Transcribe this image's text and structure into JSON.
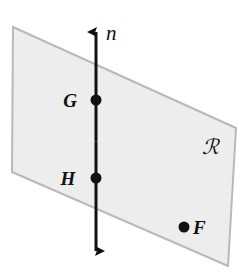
{
  "figure": {
    "background_color": "#ffffff",
    "width": 249,
    "height": 277
  },
  "plane": {
    "name": "plane-R",
    "label": "ℛ",
    "label_plain": "R",
    "fill_color": "#ededed",
    "stroke_color": "#b9b9b9",
    "stroke_width": 2,
    "corners": [
      {
        "x": 13,
        "y": 27
      },
      {
        "x": 236,
        "y": 128
      },
      {
        "x": 228,
        "y": 266
      },
      {
        "x": 12,
        "y": 172
      }
    ],
    "label_position": {
      "x": 202,
      "y": 154
    }
  },
  "line": {
    "name": "line-n",
    "label": "n",
    "color": "#111111",
    "stroke_width": 3,
    "x": 96,
    "top_tip_y": 26,
    "bottom_tip_y": 257,
    "arrowheads": "both",
    "label_position": {
      "x": 106,
      "y": 40
    }
  },
  "points": [
    {
      "id": "point-G",
      "label": "G",
      "x": 96,
      "y": 100,
      "radius": 5,
      "color": "#111111",
      "label_position": {
        "x": 70,
        "y": 107
      },
      "on_line": true
    },
    {
      "id": "point-H",
      "label": "H",
      "x": 96,
      "y": 178,
      "radius": 5,
      "color": "#111111",
      "label_position": {
        "x": 68,
        "y": 185
      },
      "on_line": true
    },
    {
      "id": "point-F",
      "label": "F",
      "x": 184,
      "y": 227,
      "radius": 5,
      "color": "#111111",
      "label_position": {
        "x": 193,
        "y": 234
      },
      "on_line": false
    }
  ]
}
